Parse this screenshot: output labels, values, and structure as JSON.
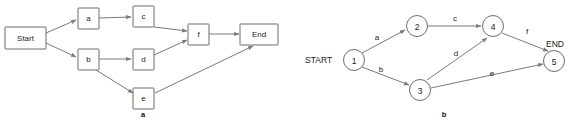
{
  "figure": {
    "background_color": "#ffffff",
    "stroke_color": "#6d6d6d",
    "edge_color": "#7a7a7a",
    "text_color": "#1a1a1a"
  },
  "panel_a": {
    "caption": "a",
    "nodes": [
      {
        "id": "start",
        "label": "Start",
        "x": 25,
        "y": 38
      },
      {
        "id": "a",
        "label": "a",
        "x": 88,
        "y": 18
      },
      {
        "id": "c",
        "label": "c",
        "x": 143,
        "y": 16
      },
      {
        "id": "b",
        "label": "b",
        "x": 88,
        "y": 59
      },
      {
        "id": "d",
        "label": "d",
        "x": 143,
        "y": 59
      },
      {
        "id": "e",
        "label": "e",
        "x": 143,
        "y": 98
      },
      {
        "id": "f",
        "label": "f",
        "x": 198,
        "y": 34
      },
      {
        "id": "end",
        "label": "End",
        "x": 259,
        "y": 34
      }
    ],
    "edges": [
      {
        "from": "start",
        "to": "a"
      },
      {
        "from": "start",
        "to": "b"
      },
      {
        "from": "a",
        "to": "c"
      },
      {
        "from": "c",
        "to": "f"
      },
      {
        "from": "b",
        "to": "d"
      },
      {
        "from": "b",
        "to": "e"
      },
      {
        "from": "d",
        "to": "f"
      },
      {
        "from": "f",
        "to": "end"
      },
      {
        "from": "e",
        "to": "end"
      }
    ]
  },
  "panel_b": {
    "caption": "b",
    "start_label": "START",
    "end_label": "END",
    "nodes": [
      {
        "id": "1",
        "label": "1",
        "cx": 354,
        "cy": 60
      },
      {
        "id": "2",
        "label": "2",
        "cx": 417,
        "cy": 26
      },
      {
        "id": "3",
        "label": "3",
        "cx": 420,
        "cy": 90
      },
      {
        "id": "4",
        "label": "4",
        "cx": 493,
        "cy": 26
      },
      {
        "id": "5",
        "label": "5",
        "cx": 554,
        "cy": 61
      }
    ],
    "edges": [
      {
        "from": "1",
        "to": "2",
        "label": "a",
        "lx": 377,
        "ly": 37
      },
      {
        "from": "1",
        "to": "3",
        "label": "b",
        "lx": 381,
        "ly": 69
      },
      {
        "from": "2",
        "to": "4",
        "label": "c",
        "lx": 455,
        "ly": 18
      },
      {
        "from": "3",
        "to": "4",
        "label": "d",
        "lx": 456,
        "ly": 53
      },
      {
        "from": "3",
        "to": "5",
        "label": "e",
        "lx": 492,
        "ly": 73
      },
      {
        "from": "4",
        "to": "5",
        "label": "f",
        "lx": 527,
        "ly": 31
      }
    ]
  }
}
